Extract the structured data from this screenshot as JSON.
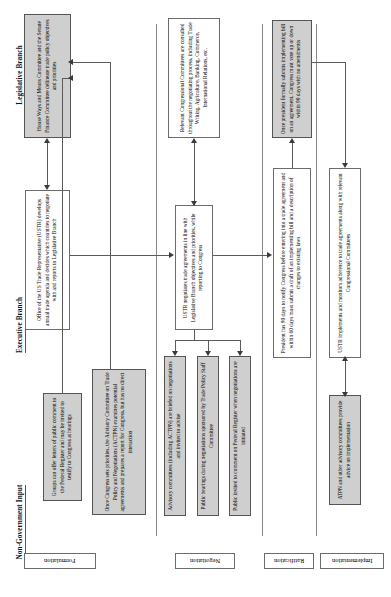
{
  "diagram": {
    "orientation": "rotated-90",
    "lanes": [
      {
        "id": "legislative",
        "label": "Legislative Branch"
      },
      {
        "id": "executive",
        "label": "Executive Branch"
      },
      {
        "id": "nongov",
        "label": "Non-Government Input"
      }
    ],
    "phases": [
      {
        "id": "formulation",
        "label": "Formulation"
      },
      {
        "id": "negotiation",
        "label": "Negotiation"
      },
      {
        "id": "ratification",
        "label": "Ratification"
      },
      {
        "id": "implementation",
        "label": "Implementation"
      }
    ],
    "boxes": [
      {
        "id": "ways-means",
        "lane": "legislative",
        "phase": "formulation",
        "style": "gray",
        "text": "House Ways and Means Committee and the Senate Finance Committee delineate trade policy objectives and priorities"
      },
      {
        "id": "ustr-formulation",
        "lane": "executive",
        "phase": "formulation",
        "style": "white",
        "text": "Office of the US Trade Representative (USTR) develops annual trade agenda and decides which countries to negotiate with and reports to Legislative Branch"
      },
      {
        "id": "public-letters",
        "lane": "nongov",
        "phase": "formulation",
        "style": "gray",
        "text": "Groups can offer letters of public comment to the Federal Register and may be invited to testify to Congress at hearings"
      },
      {
        "id": "actpn-formulation",
        "lane": "nongov",
        "phase": "formulation",
        "style": "gray",
        "text": "Once Congress sets priorities, the Advisory Committee on Trade Policy and Negotiations (ACTPN) examines potential agreements and prepares a report for Congress, but has no direct interaction"
      },
      {
        "id": "congressional-committees",
        "lane": "legislative",
        "phase": "negotiation",
        "style": "white",
        "text": "Relevant Congressional Committees are consulted throughout the negotiating process, including Trade Writing, Agriculture, Banking, Commerce, International Relations, etc."
      },
      {
        "id": "ustr-negotiates",
        "lane": "executive",
        "phase": "negotiation",
        "style": "white",
        "text": "USTR negotiates trade agreements in line with Legislative Branch objectives and priorities, while reporting to Congress"
      },
      {
        "id": "advisory-briefed",
        "lane": "nongov",
        "phase": "negotiation",
        "style": "gray",
        "text": "Advisory committees (including ACTPN) are briefed on negotiations and invited to advise"
      },
      {
        "id": "public-hearings",
        "lane": "nongov",
        "phase": "negotiation",
        "style": "gray",
        "text": "Public hearings during negotiations sponsored by Trade Policy Staff Committee"
      },
      {
        "id": "public-comment",
        "lane": "nongov",
        "phase": "negotiation",
        "style": "gray",
        "text": "Public invited to comment on Federal Register when negotiations are initiated"
      },
      {
        "id": "president-submits",
        "lane": "legislative",
        "phase": "ratification",
        "style": "gray",
        "text": "Once president formally submits implementing bill on an agreement, Congress must vote up or down within 90 days with no amendments"
      },
      {
        "id": "president-notify",
        "lane": "executive",
        "phase": "ratification",
        "style": "white",
        "text": "President has 90 days to notify Congress before entering into a trade agreement and within 60 days must submit a draft of an implementing bill and a description of changes to existing laws"
      },
      {
        "id": "ustr-implements",
        "lane": "executive",
        "phase": "implementation",
        "style": "white",
        "text": "USTR implements and monitors adherence to trade agreements along with relevant Congressional Committees"
      },
      {
        "id": "atpn-advice",
        "lane": "nongov",
        "phase": "implementation",
        "style": "gray",
        "text": "ATPN and other advisory committees provide advice on implementation"
      }
    ]
  }
}
